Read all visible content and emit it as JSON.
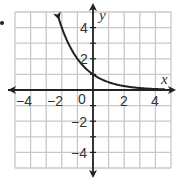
{
  "chart_data": {
    "type": "line",
    "title": "",
    "xlabel": "x",
    "ylabel": "y",
    "xlim": [
      -5,
      5
    ],
    "ylim": [
      -5,
      5
    ],
    "grid": true,
    "x_ticks": [
      "-4",
      "-2",
      "0",
      "2",
      "4"
    ],
    "y_ticks": [
      "4",
      "2",
      "-2",
      "-4"
    ],
    "series": [
      {
        "name": "exponential decay curve",
        "function": "y = (1/2)^x",
        "x": [
          -2.2,
          -2,
          -1,
          0,
          1,
          2,
          3,
          4,
          4.5
        ],
        "y": [
          4.6,
          4,
          2,
          1,
          0.5,
          0.25,
          0.125,
          0.0625,
          0.044
        ],
        "arrow_ends": true
      }
    ],
    "colors": {
      "grid": "#c8c8c8",
      "axis": "#222222",
      "curve": "#222222"
    }
  },
  "labels": {
    "x_axis": "x",
    "y_axis": "y",
    "origin": "0",
    "xt_neg4": "−4",
    "xt_neg2": "−2",
    "xt_2": "2",
    "xt_4": "4",
    "yt_4": "4",
    "yt_2": "2",
    "yt_neg2": "−2",
    "yt_neg4": "−4"
  }
}
